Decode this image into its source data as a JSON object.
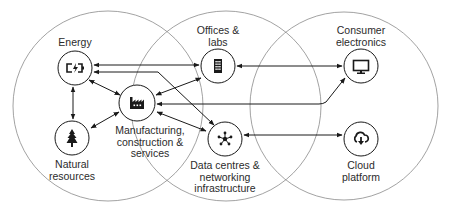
{
  "diagram": {
    "colors": {
      "line": "#1a1a1a",
      "region": "#8a8a8a",
      "text": "#2b2b2b",
      "background": "#ffffff"
    },
    "regions": [
      {
        "id": "region-left",
        "cx": 108,
        "cy": 106,
        "r": 95
      },
      {
        "id": "region-middle",
        "cx": 226,
        "cy": 106,
        "r": 95
      },
      {
        "id": "region-right",
        "cx": 344,
        "cy": 106,
        "r": 94
      }
    ],
    "nodes": [
      {
        "id": "energy",
        "label": "Energy",
        "icon": "battery-charging-icon",
        "cx": 75,
        "cy": 68,
        "r": 17,
        "label_x": 75,
        "label_y": 37
      },
      {
        "id": "offices",
        "label": "Offices &\nlabs",
        "icon": "office-building-icon",
        "cx": 218,
        "cy": 66,
        "r": 17,
        "label_x": 218,
        "label_y": 25
      },
      {
        "id": "consumer",
        "label": "Consumer\nelectronics",
        "icon": "monitor-icon",
        "cx": 361,
        "cy": 66,
        "r": 17,
        "label_x": 361,
        "label_y": 25
      },
      {
        "id": "manufacturing",
        "label": "Manufacturing,\nconstruction &\nservices",
        "icon": "factory-icon",
        "cx": 137,
        "cy": 103,
        "r": 18,
        "label_x": 150,
        "label_y": 125
      },
      {
        "id": "natural",
        "label": "Natural\nresources",
        "icon": "tree-icon",
        "cx": 72,
        "cy": 138,
        "r": 17,
        "label_x": 72,
        "label_y": 159
      },
      {
        "id": "datacentres",
        "label": "Data centres &\nnetworking\ninfrastructure",
        "icon": "network-hub-icon",
        "cx": 225,
        "cy": 139,
        "r": 17,
        "label_x": 225,
        "label_y": 160
      },
      {
        "id": "cloud",
        "label": "Cloud\nplatform",
        "icon": "cloud-download-icon",
        "cx": 361,
        "cy": 139,
        "r": 17,
        "label_x": 361,
        "label_y": 160
      }
    ],
    "connections": [
      {
        "from": "energy",
        "to": "offices",
        "type": "bidirectional"
      },
      {
        "from": "energy",
        "to": "datacentres",
        "type": "bidirectional"
      },
      {
        "from": "energy",
        "to": "manufacturing",
        "type": "bidirectional"
      },
      {
        "from": "energy",
        "to": "natural",
        "type": "bidirectional"
      },
      {
        "from": "manufacturing",
        "to": "natural",
        "type": "bidirectional"
      },
      {
        "from": "manufacturing",
        "to": "offices",
        "type": "bidirectional"
      },
      {
        "from": "manufacturing",
        "to": "consumer",
        "type": "bidirectional"
      },
      {
        "from": "manufacturing",
        "to": "datacentres",
        "type": "bidirectional"
      },
      {
        "from": "offices",
        "to": "consumer",
        "type": "bidirectional"
      },
      {
        "from": "datacentres",
        "to": "cloud",
        "type": "bidirectional"
      }
    ]
  }
}
